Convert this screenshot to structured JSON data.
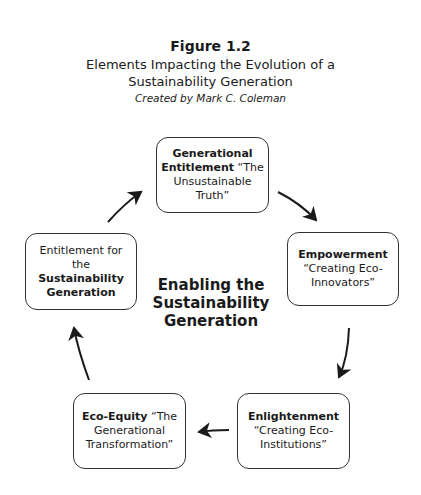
{
  "figure": {
    "label": "Figure 1.2",
    "subtitle_line1": "Elements Impacting the Evolution of a",
    "subtitle_line2": "Sustainability Generation",
    "credit": "Created by Mark C. Coleman"
  },
  "center": {
    "line1": "Enabling the",
    "line2": "Sustainability",
    "line3": "Generation"
  },
  "nodes": {
    "top": {
      "bold1": "Generational",
      "bold2": "Entitlement",
      "rest": " “The Unsustainable Truth”"
    },
    "right": {
      "bold": "Empowerment",
      "rest": "“Creating Eco-Innovators”"
    },
    "bottom_right": {
      "bold": "Enlightenment",
      "rest": "“Creating Eco-Institutions”"
    },
    "bottom_left": {
      "bold": "Eco-Equity",
      "rest": " “The Generational Transformation”"
    },
    "left": {
      "plain": "Entitlement for the",
      "bold1": "Sustainability",
      "bold2": "Generation"
    }
  },
  "flow": [
    "top",
    "right",
    "bottom_right",
    "bottom_left",
    "left",
    "top"
  ]
}
